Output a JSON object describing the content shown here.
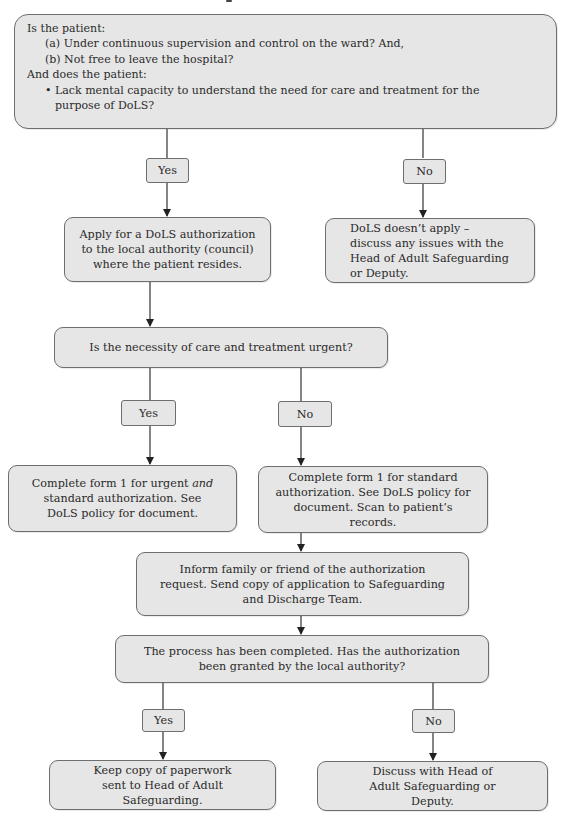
{
  "diagram": {
    "type": "flowchart",
    "theme_colors": {
      "box_fill": "#e6e6e6",
      "border": "#6e6e6e",
      "line": "#333333",
      "text": "#2a2a2a"
    },
    "start": {
      "line1": "Is the patient:",
      "line2": "(a) Under continuous supervision and control on the ward? And,",
      "line3": "(b) Not free to leave the hospital?",
      "line4": "And does the patient:",
      "bullet": "•",
      "line5": "Lack mental capacity to understand the need for care and treatment for the purpose of DoLS?"
    },
    "q1_yes": "Yes",
    "q1_no": "No",
    "apply": "Apply for a DoLS authorization to the local authority (council) where the patient resides.",
    "not_apply": "DoLS doesn’t apply – discuss any issues with the Head of Adult Safeguarding or Deputy.",
    "urgent_question": "Is the necessity of care and treatment urgent?",
    "q2_yes": "Yes",
    "q2_no": "No",
    "form_urgent": {
      "part1": "Complete form 1 for urgent ",
      "italic": "and",
      "part2": " standard authorization. See DoLS policy for document."
    },
    "form_standard": "Complete form 1 for standard authorization. See DoLS policy for document. Scan to patient’s records.",
    "inform": "Inform family or friend of the authorization request. Send copy of application to Safeguarding and Discharge Team.",
    "granted_question": "The process has been completed. Has the authorization been granted by the local authority?",
    "q3_yes": "Yes",
    "q3_no": "No",
    "keep_copy": "Keep copy of paperwork sent to Head of Adult Safeguarding.",
    "discuss": "Discuss with Head of Adult Safeguarding or Deputy."
  }
}
